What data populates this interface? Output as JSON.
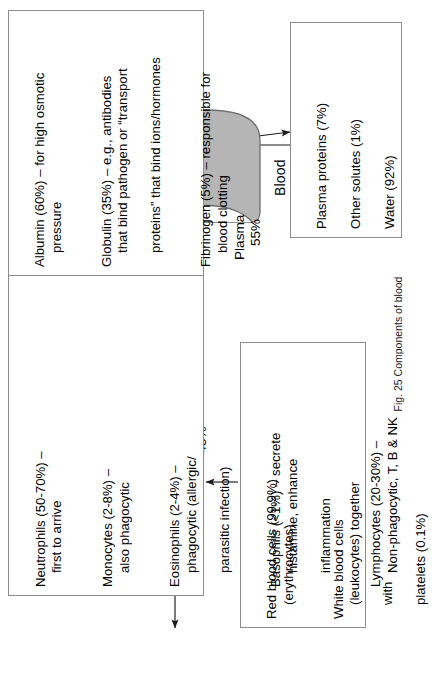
{
  "figure": {
    "caption_number": "Fig. 25",
    "caption_text": "Components of blood",
    "root_label": "Blood"
  },
  "branches": {
    "formed_elements": {
      "name": "Formed elements",
      "percent": "45%"
    },
    "plasma": {
      "name": "Plasma",
      "percent": "55%"
    }
  },
  "formed_elements_box": {
    "items": [
      {
        "line1": "Red blood cells (99.9%)",
        "line2": "(erythrocytes)"
      },
      {
        "line1": "White blood cells",
        "line2": "(leukocytes) together",
        "line3": "with",
        "line4": "platelets (0.1%)"
      }
    ]
  },
  "white_blood_cell_types_box": {
    "items": [
      {
        "line1": "Neutrophils (50-70%) –",
        "line2": "first to arrive"
      },
      {
        "line1": "Monocytes (2-8%) –",
        "line2": "also phagocytic"
      },
      {
        "line1": "Eosinophils (2-4%) –",
        "line2": "phagocytic (allergic/",
        "line3": "parasitic infection)"
      },
      {
        "line1": "Basophils (<1%) – secrete",
        "line2": "histamine, enhance",
        "line3": "inflammation"
      },
      {
        "line1": "Lymphocytes (20-30%) –",
        "line2": "Non-phagocytic, T, B & NK"
      }
    ]
  },
  "plasma_parts_box": {
    "items": [
      {
        "line1": "Plasma proteins (7%)"
      },
      {
        "line1": "Other solutes (1%)"
      },
      {
        "line1": "Water (92%)"
      }
    ]
  },
  "plasma_proteins_detail_box": {
    "items": [
      {
        "line1": "Albumin (60%) – for high osmotic",
        "line2": "pressure"
      },
      {
        "line1": "Globulin (35%) – e.g., antibodies",
        "line2": "that bind pathogen or “transport",
        "line3": "proteins” that bind ions/hormones"
      },
      {
        "line1": "Fibrinogen (5%) – responsible for",
        "line2": "blood clotting"
      }
    ]
  },
  "colors": {
    "blood_fill": "#b5b5b5",
    "blood_stroke": "#6f6f6f",
    "box_border": "#8d8d8d",
    "connector": "#1a1a1a",
    "text": "#000000"
  }
}
